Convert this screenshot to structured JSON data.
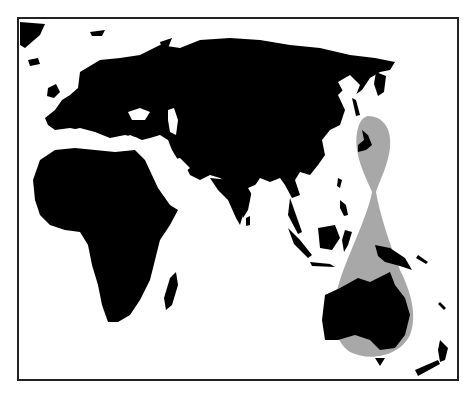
{
  "map": {
    "kind": "world map (Eastern Hemisphere)",
    "land_color": "#000000",
    "water_color": "#ffffff",
    "highlight_color": "#a8a8a8",
    "frame_color": "#222222",
    "highlight_region": "Japan through Indonesia to Australia (distribution range)",
    "regions": [
      "Europe",
      "Asia",
      "Africa",
      "Australia",
      "Arabian Peninsula",
      "Indian subcontinent",
      "Madagascar",
      "New Guinea",
      "New Zealand",
      "Japan"
    ]
  }
}
